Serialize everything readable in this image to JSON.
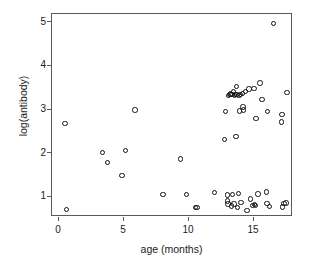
{
  "chart_data": {
    "type": "scatter",
    "title": "",
    "xlabel": "age (months)",
    "ylabel": "log(antibody)",
    "xlim": [
      -0.55,
      18.0
    ],
    "ylim": [
      0.55,
      5.2
    ],
    "xticks": [
      0,
      5,
      10,
      15
    ],
    "yticks": [
      1,
      2,
      3,
      4,
      5
    ],
    "xtick_labels": [
      "0",
      "5",
      "10",
      "15"
    ],
    "ytick_labels": [
      "1",
      "2",
      "3",
      "4",
      "5"
    ],
    "grid": false,
    "legend": null,
    "marker": "open-circle",
    "marker_color": "#111111",
    "frame_color": "#5a5a5a",
    "background": "#ffffff",
    "n_points": 62,
    "points": [
      {
        "x": 0.45,
        "y": 2.69
      },
      {
        "x": 0.55,
        "y": 0.72
      },
      {
        "x": 3.35,
        "y": 2.03
      },
      {
        "x": 3.7,
        "y": 1.8
      },
      {
        "x": 4.85,
        "y": 1.5
      },
      {
        "x": 5.1,
        "y": 2.08
      },
      {
        "x": 5.85,
        "y": 3.0
      },
      {
        "x": 8.0,
        "y": 1.07
      },
      {
        "x": 9.35,
        "y": 1.88
      },
      {
        "x": 9.8,
        "y": 1.07
      },
      {
        "x": 10.5,
        "y": 0.77
      },
      {
        "x": 10.6,
        "y": 0.77
      },
      {
        "x": 11.95,
        "y": 1.11
      },
      {
        "x": 12.75,
        "y": 2.33
      },
      {
        "x": 12.8,
        "y": 2.96
      },
      {
        "x": 12.95,
        "y": 0.92
      },
      {
        "x": 12.95,
        "y": 1.05
      },
      {
        "x": 13.0,
        "y": 0.85
      },
      {
        "x": 13.05,
        "y": 3.34
      },
      {
        "x": 13.15,
        "y": 3.35
      },
      {
        "x": 13.2,
        "y": 3.37
      },
      {
        "x": 13.25,
        "y": 0.8
      },
      {
        "x": 13.3,
        "y": 3.36
      },
      {
        "x": 13.35,
        "y": 1.06
      },
      {
        "x": 13.4,
        "y": 3.43
      },
      {
        "x": 13.45,
        "y": 0.85
      },
      {
        "x": 13.5,
        "y": 3.33
      },
      {
        "x": 13.55,
        "y": 3.35
      },
      {
        "x": 13.6,
        "y": 2.4
      },
      {
        "x": 13.65,
        "y": 3.54
      },
      {
        "x": 13.7,
        "y": 3.36
      },
      {
        "x": 13.75,
        "y": 0.77
      },
      {
        "x": 13.8,
        "y": 1.09
      },
      {
        "x": 13.85,
        "y": 3.34
      },
      {
        "x": 13.9,
        "y": 2.98
      },
      {
        "x": 13.95,
        "y": 3.35
      },
      {
        "x": 14.0,
        "y": 0.88
      },
      {
        "x": 14.1,
        "y": 3.38
      },
      {
        "x": 14.15,
        "y": 3.07
      },
      {
        "x": 14.2,
        "y": 3.0
      },
      {
        "x": 14.35,
        "y": 3.42
      },
      {
        "x": 14.45,
        "y": 0.7
      },
      {
        "x": 14.6,
        "y": 3.48
      },
      {
        "x": 14.75,
        "y": 0.96
      },
      {
        "x": 14.9,
        "y": 0.81
      },
      {
        "x": 15.0,
        "y": 3.49
      },
      {
        "x": 15.05,
        "y": 0.84
      },
      {
        "x": 15.1,
        "y": 0.82
      },
      {
        "x": 15.15,
        "y": 2.81
      },
      {
        "x": 15.3,
        "y": 1.08
      },
      {
        "x": 15.45,
        "y": 3.62
      },
      {
        "x": 15.6,
        "y": 3.24
      },
      {
        "x": 15.95,
        "y": 1.12
      },
      {
        "x": 16.0,
        "y": 0.86
      },
      {
        "x": 16.05,
        "y": 2.96
      },
      {
        "x": 16.2,
        "y": 0.79
      },
      {
        "x": 16.5,
        "y": 4.98
      },
      {
        "x": 17.1,
        "y": 2.73
      },
      {
        "x": 17.15,
        "y": 2.9
      },
      {
        "x": 17.2,
        "y": 0.78
      },
      {
        "x": 17.3,
        "y": 0.86
      },
      {
        "x": 17.45,
        "y": 0.87
      },
      {
        "x": 17.55,
        "y": 3.4
      }
    ]
  }
}
